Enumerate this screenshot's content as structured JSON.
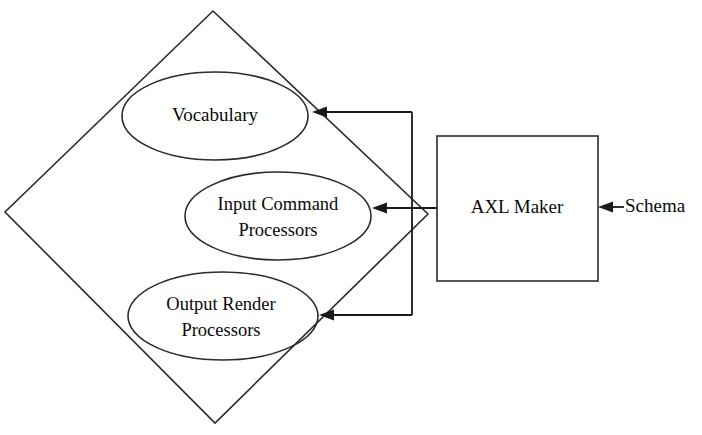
{
  "diagram": {
    "background_color": "#ffffff",
    "stroke_color": "#2b2b2b",
    "container": {
      "name": "diamond-container",
      "shape": "diamond"
    },
    "nodes": [
      {
        "id": "vocabulary",
        "shape": "ellipse",
        "label": "Vocabulary",
        "lines": [
          "Vocabulary"
        ]
      },
      {
        "id": "input-command-processors",
        "shape": "ellipse",
        "label": "Input Command Processors",
        "lines": [
          "Input Command",
          "Processors"
        ]
      },
      {
        "id": "output-render-processors",
        "shape": "ellipse",
        "label": "Output Render Processors",
        "lines": [
          "Output Render",
          "Processors"
        ]
      },
      {
        "id": "axl-maker",
        "shape": "rectangle",
        "label": "AXL Maker",
        "lines": [
          "AXL Maker"
        ]
      }
    ],
    "external_labels": [
      {
        "id": "schema",
        "label": "Schema"
      }
    ],
    "connections": [
      {
        "id": "axl-maker-to-vocabulary",
        "from": "axl-maker",
        "to": "vocabulary",
        "arrow": "to"
      },
      {
        "id": "axl-maker-to-input-command-processors",
        "from": "axl-maker",
        "to": "input-command-processors",
        "arrow": "to"
      },
      {
        "id": "axl-maker-to-output-render-processors",
        "from": "axl-maker",
        "to": "output-render-processors",
        "arrow": "to"
      },
      {
        "id": "schema-to-axl-maker",
        "from": "schema",
        "to": "axl-maker",
        "arrow": "to"
      }
    ]
  }
}
